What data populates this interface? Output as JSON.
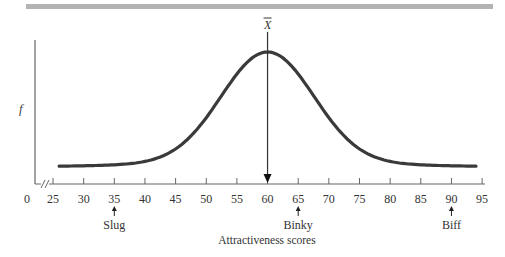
{
  "chart_data": {
    "type": "line",
    "title": "",
    "xlabel": "Attractiveness scores",
    "ylabel": "f",
    "xlim": [
      25,
      95
    ],
    "x_ticks": [
      0,
      25,
      30,
      35,
      40,
      45,
      50,
      55,
      60,
      65,
      70,
      75,
      80,
      85,
      90,
      95
    ],
    "x_tick_labels": [
      "0",
      "25",
      "30",
      "35",
      "40",
      "45",
      "50",
      "55",
      "60",
      "65",
      "70",
      "75",
      "80",
      "85",
      "90",
      "95"
    ],
    "axis_break": true,
    "grid": false,
    "legend": null,
    "series": [
      {
        "name": "Frequency distribution (normal curve)",
        "mean": 60,
        "description": "Bell-shaped curve peaking at score 60, tails extending from 26 to 94"
      }
    ],
    "mean_marker": {
      "label": "X̄",
      "x": 60
    },
    "annotations": [
      {
        "label": "Slug",
        "x": 35
      },
      {
        "label": "Binky",
        "x": 65
      },
      {
        "label": "Biff",
        "x": 90
      }
    ]
  },
  "colors": {
    "curve": "#3a3a3a",
    "axis": "#666666",
    "top_bar": "#b3b3b3"
  }
}
